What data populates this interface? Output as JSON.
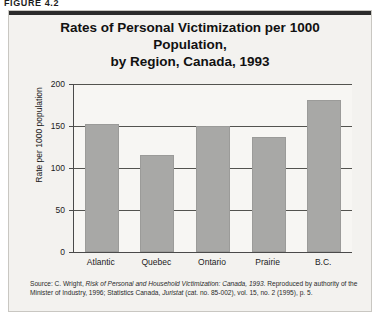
{
  "figure": {
    "number_label": "FIGURE 4.2"
  },
  "chart_data": {
    "type": "bar",
    "title": "Rates of Personal Victimization per 1000 Population, by Region, Canada, 1993",
    "title_line1": "Rates of Personal Victimization per 1000 Population,",
    "title_line2": "by Region, Canada, 1993",
    "categories": [
      "Atlantic",
      "Quebec",
      "Ontario",
      "Prairie",
      "B.C."
    ],
    "values": [
      152,
      115,
      150,
      137,
      181
    ],
    "xlabel": "",
    "ylabel": "Rate per 1000 population",
    "ylim": [
      0,
      200
    ],
    "yticks": [
      0,
      50,
      100,
      150,
      200
    ],
    "ytick_labels": [
      "0",
      "50",
      "100",
      "150",
      "200"
    ],
    "grid": true,
    "legend": "none",
    "bar_color": "#a8a8a6",
    "axis_color": "#4a4a4a",
    "background_color": "#f3f2ef"
  },
  "source": {
    "prefix": "Source: C. Wright, ",
    "italic_title": "Risk of Personal and Household Victimization: Canada, 1993",
    "middle": ". Reproduced by authority of the Minister of Industry, 1996; Statistics Canada, ",
    "italic_pub": "Juristat",
    "suffix": " (cat. no. 85-002), vol. 15, no. 2 (1995), p. 5."
  }
}
